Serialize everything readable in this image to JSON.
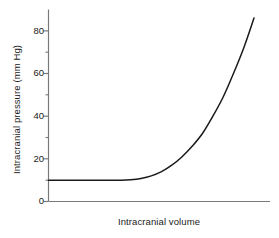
{
  "chart_data": {
    "type": "line",
    "title": "",
    "xlabel": "Intracranial volume",
    "ylabel": "Intracranial pressure (mm Hg)",
    "ylim": [
      0,
      90
    ],
    "xlim": [
      0,
      100
    ],
    "grid": false,
    "legend": null,
    "y_major_ticks": [
      0,
      20,
      40,
      60,
      80
    ],
    "y_minor_ticks": [
      10,
      30,
      50,
      70
    ],
    "y_tick_labels": [
      "0",
      "20",
      "40",
      "60",
      "80"
    ],
    "x_tick_labels": [],
    "series": [
      {
        "name": "Intracranial pressure-volume curve",
        "color": "#1a1a1a",
        "x": [
          0,
          5,
          10,
          15,
          20,
          25,
          30,
          35,
          40,
          45,
          50,
          55,
          60,
          65,
          70,
          75,
          80,
          85,
          90,
          95,
          100
        ],
        "y": [
          10,
          10,
          10,
          10,
          10,
          10,
          10,
          10,
          10.2,
          10.8,
          12,
          14,
          17,
          21,
          26,
          32,
          40,
          49,
          60,
          72,
          86
        ]
      }
    ]
  },
  "axis": {
    "y_title": "Intracranial pressure (mm Hg)",
    "x_title": "Intracranial volume",
    "labels": {
      "t0": "0",
      "t20": "20",
      "t40": "40",
      "t60": "60",
      "t80": "80"
    }
  },
  "colors": {
    "curve": "#1a1a1a",
    "axis": "#7a7a7a",
    "text": "#1a1a1a",
    "background": "#ffffff"
  }
}
